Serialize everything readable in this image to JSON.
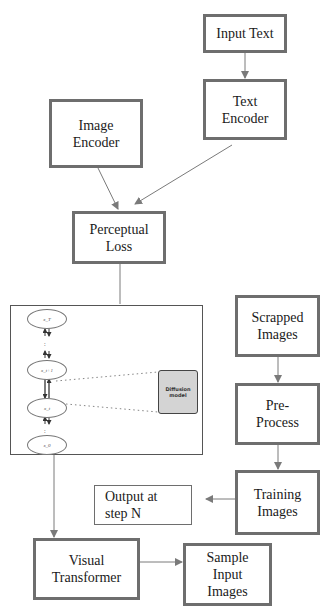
{
  "diagram": {
    "nodes": {
      "input_text": "Input Text",
      "text_encoder": "Text\nEncoder",
      "image_encoder": "Image\nEncoder",
      "perceptual_loss": "Perceptual\nLoss",
      "scrapped_images": "Scrapped\nImages",
      "pre_process": "Pre-\nProcess",
      "training_images": "Training\nImages",
      "output_step_n": "Output at\nstep N",
      "visual_transformer": "Visual\nTransformer",
      "sample_input_images": "Sample\nInput\nImages"
    },
    "diffusion": {
      "states": [
        "x_T",
        "x_t+1",
        "x_t",
        "x_0"
      ],
      "model_label": "Diffusion\nmodel"
    },
    "edges": [
      {
        "from": "Input Text",
        "to": "Text Encoder"
      },
      {
        "from": "Text Encoder",
        "to": "Perceptual Loss"
      },
      {
        "from": "Image Encoder",
        "to": "Perceptual Loss"
      },
      {
        "from": "Perceptual Loss",
        "to": "Diffusion process"
      },
      {
        "from": "Scrapped Images",
        "to": "Pre-Process"
      },
      {
        "from": "Pre-Process",
        "to": "Training Images"
      },
      {
        "from": "Training Images",
        "to": "Output at step N"
      },
      {
        "from": "Diffusion process",
        "to": "Visual Transformer"
      },
      {
        "from": "Visual Transformer",
        "to": "Sample Input Images"
      }
    ],
    "colors": {
      "box_border": "#6e6e6e",
      "arrow": "#7a7a7a",
      "model_fill": "#d4d4d4"
    }
  }
}
